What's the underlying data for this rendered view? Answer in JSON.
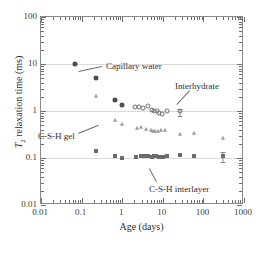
{
  "chart_data": {
    "type": "scatter",
    "title": "",
    "xlabel": "Age (days)",
    "ylabel": "T2 relaxation time (ms)",
    "ylabel_parts": {
      "italic": "T",
      "sub": "2",
      "rest": " relaxation time (ms)"
    },
    "xscale": "log",
    "yscale": "log",
    "xlim": [
      0.01,
      1000
    ],
    "ylim": [
      0.01,
      100
    ],
    "grid": "horizontal-major",
    "legend": "none",
    "xticks": [
      0.01,
      0.1,
      1,
      10,
      100,
      1000
    ],
    "xtick_labels": [
      "0.01",
      "0.1",
      "1",
      "10",
      "100",
      "1000"
    ],
    "yticks": [
      0.01,
      0.1,
      1,
      10,
      100
    ],
    "ytick_labels": [
      "0.01",
      "0.1",
      "1",
      "10",
      "100"
    ],
    "series": [
      {
        "name": "Capillary water",
        "marker": "filled-circle",
        "color": "#4d4d4d",
        "size": 5,
        "points": [
          {
            "x": 0.07,
            "y": 9.8
          },
          {
            "x": 0.22,
            "y": 5.0
          },
          {
            "x": 0.68,
            "y": 1.75
          },
          {
            "x": 1.0,
            "y": 1.35
          }
        ]
      },
      {
        "name": "Interhydrate",
        "marker": "open-circle",
        "color": "#6e6e6e",
        "size": 5,
        "points": [
          {
            "x": 2.1,
            "y": 1.2
          },
          {
            "x": 2.6,
            "y": 1.2
          },
          {
            "x": 3.3,
            "y": 1.15
          },
          {
            "x": 4.2,
            "y": 1.25
          },
          {
            "x": 5.4,
            "y": 1.05
          },
          {
            "x": 6.2,
            "y": 1.0
          },
          {
            "x": 7.0,
            "y": 1.0
          },
          {
            "x": 8.0,
            "y": 0.92
          },
          {
            "x": 9.5,
            "y": 0.85
          },
          {
            "x": 13.0,
            "y": 1.0
          },
          {
            "x": 26.0,
            "y": 1.0,
            "yerr_low": 0.78,
            "yerr_high": 1.1
          }
        ]
      },
      {
        "name": "C-S-H gel",
        "marker": "triangle",
        "color": "#9a9a9a",
        "size": 5,
        "points": [
          {
            "x": 0.22,
            "y": 2.05
          },
          {
            "x": 0.68,
            "y": 0.63
          },
          {
            "x": 1.0,
            "y": 0.52
          },
          {
            "x": 2.3,
            "y": 0.44
          },
          {
            "x": 2.9,
            "y": 0.46
          },
          {
            "x": 3.9,
            "y": 0.42
          },
          {
            "x": 5.2,
            "y": 0.39
          },
          {
            "x": 5.9,
            "y": 0.38
          },
          {
            "x": 6.6,
            "y": 0.38
          },
          {
            "x": 7.6,
            "y": 0.38
          },
          {
            "x": 9.0,
            "y": 0.4
          },
          {
            "x": 11.5,
            "y": 0.4
          },
          {
            "x": 26.0,
            "y": 0.33
          },
          {
            "x": 60.0,
            "y": 0.34
          },
          {
            "x": 300.0,
            "y": 0.27
          }
        ]
      },
      {
        "name": "C-S-H interlayer",
        "marker": "filled-square",
        "color": "#6b6b6b",
        "size": 4,
        "points": [
          {
            "x": 0.22,
            "y": 0.143
          },
          {
            "x": 0.68,
            "y": 0.113
          },
          {
            "x": 1.0,
            "y": 0.1
          },
          {
            "x": 2.2,
            "y": 0.104
          },
          {
            "x": 2.9,
            "y": 0.112
          },
          {
            "x": 3.6,
            "y": 0.112
          },
          {
            "x": 4.4,
            "y": 0.112
          },
          {
            "x": 5.4,
            "y": 0.106
          },
          {
            "x": 6.1,
            "y": 0.108
          },
          {
            "x": 6.8,
            "y": 0.108
          },
          {
            "x": 8.0,
            "y": 0.104
          },
          {
            "x": 10.0,
            "y": 0.104
          },
          {
            "x": 13.0,
            "y": 0.108
          },
          {
            "x": 26.0,
            "y": 0.118
          },
          {
            "x": 60.0,
            "y": 0.108
          },
          {
            "x": 300.0,
            "y": 0.108,
            "yerr_low": 0.082,
            "yerr_high": 0.132
          }
        ]
      }
    ],
    "annotations": [
      {
        "text": "Capillary water",
        "label_x": 105,
        "label_y": 60,
        "leader_from_x": 101,
        "leader_from_y": 66,
        "leader_to_x": 78,
        "leader_to_y": 71
      },
      {
        "text": "Interhydrate",
        "label_x": 174,
        "label_y": 80,
        "leader_from_x": 189,
        "leader_from_y": 90,
        "leader_to_x": 176,
        "leader_to_y": 104
      },
      {
        "text": "C-S-H gel",
        "label_x": 37,
        "label_y": 130,
        "leader_from_x": 77,
        "leader_from_y": 132,
        "leader_to_x": 97,
        "leader_to_y": 124
      },
      {
        "text": "C-S-H interlayer",
        "label_x": 148,
        "label_y": 183,
        "leader_from_x": 155,
        "leader_from_y": 181,
        "leader_to_x": 148,
        "leader_to_y": 168
      }
    ]
  }
}
